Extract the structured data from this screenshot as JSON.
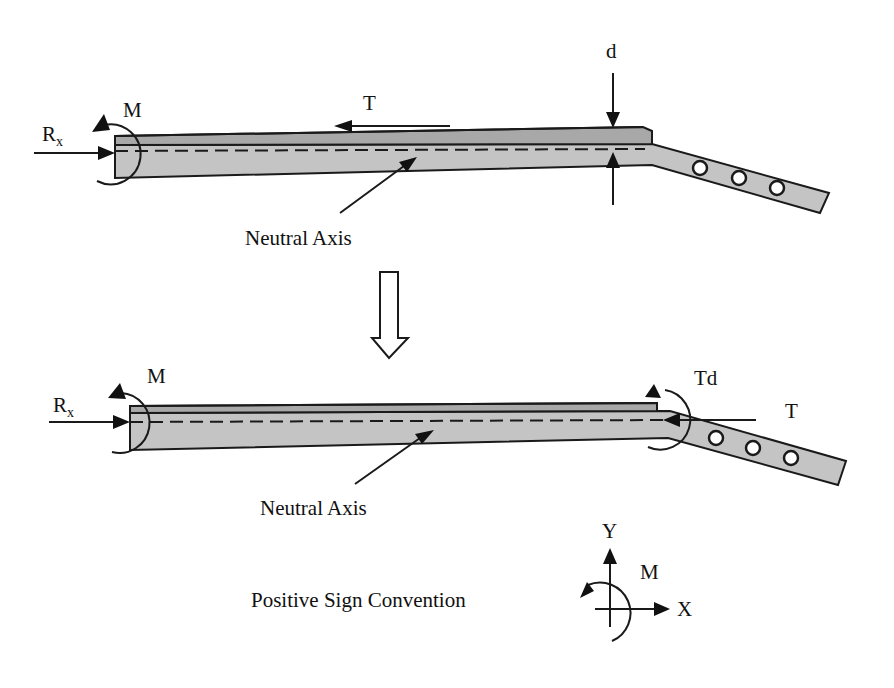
{
  "figure": {
    "top_diagram": {
      "labels": {
        "reaction_force": "R",
        "reaction_force_subscript": "x",
        "moment": "M",
        "tension": "T",
        "offset": "d",
        "neutral_axis": "Neutral Axis"
      },
      "hole_count": 3
    },
    "transition_arrow": "hollow down arrow",
    "bottom_diagram": {
      "labels": {
        "reaction_force": "R",
        "reaction_force_subscript": "x",
        "moment": "M",
        "tension_moment": "Td",
        "tension": "T",
        "neutral_axis": "Neutral Axis"
      },
      "hole_count": 3
    },
    "sign_convention": {
      "caption": "Positive Sign Convention",
      "axis_y": "Y",
      "axis_x": "X",
      "moment": "M"
    },
    "colors": {
      "beam_fill": "#c4c4c4",
      "plate_fill": "#a8a8a8",
      "stroke": "#1a1a1a",
      "background": "#ffffff"
    }
  }
}
